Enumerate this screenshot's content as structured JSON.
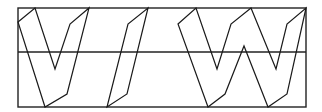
{
  "diagram": {
    "glyphs": [
      {
        "name": "V",
        "character": "V"
      },
      {
        "name": "slash",
        "character": "/"
      },
      {
        "name": "W",
        "character": "W"
      }
    ],
    "guides": [
      "top-line",
      "mid-line",
      "bottom-line"
    ],
    "colors": {
      "stroke": "#1a1a1a",
      "background": "#ffffff"
    }
  }
}
